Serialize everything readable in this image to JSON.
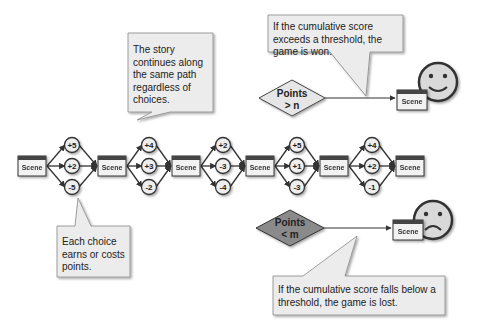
{
  "scene_label": "Scene",
  "choice_groups": [
    {
      "values": [
        "+5",
        "+2",
        "-5"
      ]
    },
    {
      "values": [
        "+4",
        "+3",
        "-2"
      ]
    },
    {
      "values": [
        "+2",
        "-3",
        "-4"
      ]
    },
    {
      "values": [
        "+5",
        "+1",
        "-3"
      ]
    },
    {
      "values": [
        "+4",
        "+2",
        "-1"
      ]
    }
  ],
  "callouts": {
    "story": "The story continues along the same path regardless of choices.",
    "choice": "Each choice earns or costs points.",
    "won": "If the cumulative score exceeds a threshold, the game is won.",
    "lost": "If the cumulative score falls below a threshold, the game is lost."
  },
  "win_condition": {
    "line1": "Points",
    "line2": "> n",
    "outcome_icon": "happy-face-icon"
  },
  "lose_condition": {
    "line1": "Points",
    "line2": "< m",
    "outcome_icon": "sad-face-icon"
  },
  "colors": {
    "scene_fill": "#f2f2f2",
    "scene_header": "#444444",
    "callout_fill": "#ececec",
    "win_diamond": "#e6e6e6",
    "lose_diamond": "#8a8a8a",
    "face_fill": "#d9d9d9",
    "stroke": "#333333"
  }
}
